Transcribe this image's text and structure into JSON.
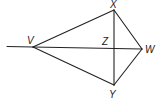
{
  "diagram": {
    "type": "kite-geometry-figure",
    "points": {
      "V": {
        "label": "V",
        "x": 33,
        "y": 47
      },
      "X": {
        "label": "X",
        "x": 114,
        "y": 10
      },
      "W": {
        "label": "W",
        "x": 142,
        "y": 49
      },
      "Y": {
        "label": "Y",
        "x": 114,
        "y": 85
      },
      "Z": {
        "label": "Z",
        "x": 114,
        "y": 48
      }
    },
    "segments": [
      [
        "V",
        "X"
      ],
      [
        "X",
        "W"
      ],
      [
        "W",
        "Y"
      ],
      [
        "Y",
        "V"
      ],
      [
        "V",
        "W"
      ],
      [
        "X",
        "Y"
      ]
    ],
    "ray_extension": {
      "from": "V",
      "to_x": 7,
      "to_y": 47
    },
    "stroke_color": "#222222"
  }
}
